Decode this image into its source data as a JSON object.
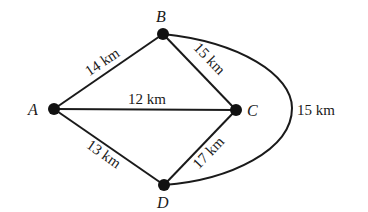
{
  "diagram": {
    "type": "weighted-graph",
    "nodes": [
      {
        "id": "A",
        "label": "A"
      },
      {
        "id": "B",
        "label": "B"
      },
      {
        "id": "C",
        "label": "C"
      },
      {
        "id": "D",
        "label": "D"
      }
    ],
    "edges": [
      {
        "from": "A",
        "to": "B",
        "label": "14 km"
      },
      {
        "from": "A",
        "to": "C",
        "label": "12 km"
      },
      {
        "from": "A",
        "to": "D",
        "label": "13 km"
      },
      {
        "from": "B",
        "to": "C",
        "label": "15 km"
      },
      {
        "from": "C",
        "to": "D",
        "label": "17 km"
      },
      {
        "from": "B",
        "to": "D",
        "label": "15 km",
        "curved": true
      }
    ]
  }
}
